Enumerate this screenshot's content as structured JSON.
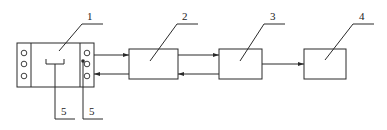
{
  "diagram": {
    "type": "block-diagram",
    "colors": {
      "stroke": "#2a2a2a",
      "background": "#ffffff"
    },
    "components": [
      {
        "id": "1",
        "label": "1"
      },
      {
        "id": "2",
        "label": "2"
      },
      {
        "id": "3",
        "label": "3"
      },
      {
        "id": "4",
        "label": "4"
      }
    ],
    "sub_labels": [
      {
        "id": "5a",
        "label": "5"
      },
      {
        "id": "5b",
        "label": "5"
      }
    ],
    "connections": [
      {
        "from": "1",
        "to": "2",
        "direction": "forward"
      },
      {
        "from": "2",
        "to": "1",
        "direction": "backward"
      },
      {
        "from": "2",
        "to": "3",
        "direction": "forward"
      },
      {
        "from": "3",
        "to": "2",
        "direction": "backward"
      },
      {
        "from": "3",
        "to": "4",
        "direction": "forward"
      }
    ]
  }
}
